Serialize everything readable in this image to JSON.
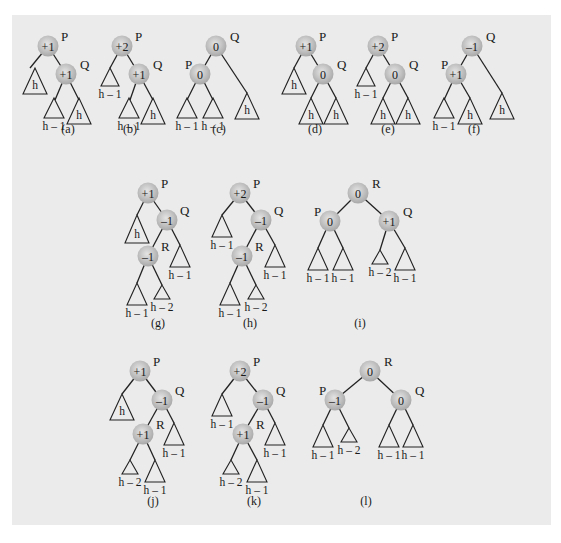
{
  "figure": {
    "panel_color": "#ebebeb",
    "node_color": "#bdbdbd",
    "line_color": "#222222"
  },
  "diagrams": [
    {
      "caption": "(a)",
      "cap": [
        68,
        133
      ],
      "nodes": [
        {
          "id": "P",
          "val": "+1",
          "x": 48,
          "y": 46,
          "lx": 61,
          "ly": 41
        },
        {
          "id": "Q",
          "val": "+1",
          "x": 66,
          "y": 74,
          "lx": 80,
          "ly": 69
        }
      ],
      "edges": [
        [
          48,
          46,
          30,
          68
        ],
        [
          48,
          46,
          66,
          74
        ],
        [
          66,
          74,
          55,
          100
        ],
        [
          66,
          74,
          79,
          100
        ]
      ],
      "subtrees": [
        {
          "x": 35,
          "top": 68,
          "w": 24,
          "h": 26,
          "label": "h",
          "inside": true
        },
        {
          "x": 54,
          "top": 98,
          "w": 20,
          "h": 20,
          "label": "h – 1",
          "inside": false
        },
        {
          "x": 79,
          "top": 98,
          "w": 24,
          "h": 26,
          "label": "h",
          "inside": true
        }
      ]
    },
    {
      "caption": "(b)",
      "cap": [
        130,
        133
      ],
      "nodes": [
        {
          "id": "P",
          "val": "+2",
          "x": 122,
          "y": 46,
          "lx": 135,
          "ly": 41
        },
        {
          "id": "Q",
          "val": "+1",
          "x": 139,
          "y": 74,
          "lx": 153,
          "ly": 69
        }
      ],
      "edges": [
        [
          122,
          46,
          110,
          68
        ],
        [
          122,
          46,
          139,
          74
        ],
        [
          139,
          74,
          130,
          100
        ],
        [
          139,
          74,
          153,
          100
        ]
      ],
      "subtrees": [
        {
          "x": 110,
          "top": 68,
          "w": 18,
          "h": 18,
          "label": "h – 1",
          "inside": false
        },
        {
          "x": 129,
          "top": 98,
          "w": 20,
          "h": 20,
          "label": "h – 1",
          "inside": false
        },
        {
          "x": 153,
          "top": 98,
          "w": 24,
          "h": 26,
          "label": "h",
          "inside": true
        }
      ]
    },
    {
      "caption": "(c)",
      "cap": [
        219,
        133
      ],
      "nodes": [
        {
          "id": "Q",
          "val": "0",
          "x": 216,
          "y": 46,
          "lx": 230,
          "ly": 41
        },
        {
          "id": "P",
          "val": "0",
          "x": 200,
          "y": 74,
          "lx": 185,
          "ly": 69
        }
      ],
      "edges": [
        [
          216,
          46,
          200,
          74
        ],
        [
          216,
          46,
          247,
          93
        ],
        [
          200,
          74,
          187,
          100
        ],
        [
          200,
          74,
          213,
          100
        ]
      ],
      "subtrees": [
        {
          "x": 187,
          "top": 98,
          "w": 20,
          "h": 20,
          "label": "h – 1",
          "inside": false
        },
        {
          "x": 213,
          "top": 98,
          "w": 20,
          "h": 20,
          "label": "h – 1",
          "inside": false
        },
        {
          "x": 247,
          "top": 93,
          "w": 24,
          "h": 26,
          "label": "h",
          "inside": true
        }
      ]
    },
    {
      "caption": "(d)",
      "cap": [
        315,
        133
      ],
      "nodes": [
        {
          "id": "P",
          "val": "+1",
          "x": 306,
          "y": 46,
          "lx": 319,
          "ly": 41
        },
        {
          "id": "Q",
          "val": "0",
          "x": 323,
          "y": 74,
          "lx": 337,
          "ly": 69
        }
      ],
      "edges": [
        [
          306,
          46,
          294,
          68
        ],
        [
          306,
          46,
          323,
          74
        ],
        [
          323,
          74,
          311,
          98
        ],
        [
          323,
          74,
          336,
          98
        ]
      ],
      "subtrees": [
        {
          "x": 294,
          "top": 68,
          "w": 24,
          "h": 26,
          "label": "h",
          "inside": true
        },
        {
          "x": 311,
          "top": 98,
          "w": 24,
          "h": 26,
          "label": "h",
          "inside": true
        },
        {
          "x": 336,
          "top": 98,
          "w": 24,
          "h": 26,
          "label": "h",
          "inside": true
        }
      ]
    },
    {
      "caption": "(e)",
      "cap": [
        388,
        133
      ],
      "nodes": [
        {
          "id": "P",
          "val": "+2",
          "x": 378,
          "y": 46,
          "lx": 391,
          "ly": 41
        },
        {
          "id": "Q",
          "val": "0",
          "x": 395,
          "y": 74,
          "lx": 409,
          "ly": 69
        }
      ],
      "edges": [
        [
          378,
          46,
          366,
          68
        ],
        [
          378,
          46,
          395,
          74
        ],
        [
          395,
          74,
          383,
          98
        ],
        [
          395,
          74,
          408,
          98
        ]
      ],
      "subtrees": [
        {
          "x": 366,
          "top": 68,
          "w": 18,
          "h": 18,
          "label": "h – 1",
          "inside": false
        },
        {
          "x": 383,
          "top": 98,
          "w": 24,
          "h": 26,
          "label": "h",
          "inside": true
        },
        {
          "x": 408,
          "top": 98,
          "w": 24,
          "h": 26,
          "label": "h",
          "inside": true
        }
      ]
    },
    {
      "caption": "(f)",
      "cap": [
        474,
        133
      ],
      "nodes": [
        {
          "id": "Q",
          "val": "–1",
          "x": 472,
          "y": 46,
          "lx": 486,
          "ly": 41
        },
        {
          "id": "P",
          "val": "+1",
          "x": 456,
          "y": 74,
          "lx": 441,
          "ly": 69
        }
      ],
      "edges": [
        [
          472,
          46,
          456,
          74
        ],
        [
          472,
          46,
          502,
          93
        ],
        [
          456,
          74,
          444,
          100
        ],
        [
          456,
          74,
          470,
          98
        ]
      ],
      "subtrees": [
        {
          "x": 444,
          "top": 98,
          "w": 20,
          "h": 20,
          "label": "h – 1",
          "inside": false
        },
        {
          "x": 470,
          "top": 98,
          "w": 24,
          "h": 26,
          "label": "h",
          "inside": true
        },
        {
          "x": 502,
          "top": 93,
          "w": 24,
          "h": 26,
          "label": "h",
          "inside": true
        }
      ]
    },
    {
      "caption": "(g)",
      "cap": [
        158,
        327
      ],
      "nodes": [
        {
          "id": "P",
          "val": "+1",
          "x": 148,
          "y": 193,
          "lx": 161,
          "ly": 188
        },
        {
          "id": "Q",
          "val": "–1",
          "x": 167,
          "y": 220,
          "lx": 180,
          "ly": 215
        },
        {
          "id": "R",
          "val": "–1",
          "x": 148,
          "y": 256,
          "lx": 161,
          "ly": 251
        }
      ],
      "edges": [
        [
          148,
          193,
          137,
          215
        ],
        [
          148,
          193,
          167,
          220
        ],
        [
          167,
          220,
          148,
          256
        ],
        [
          167,
          220,
          180,
          245
        ],
        [
          148,
          256,
          137,
          283
        ],
        [
          148,
          256,
          162,
          285
        ]
      ],
      "subtrees": [
        {
          "x": 137,
          "top": 215,
          "w": 24,
          "h": 28,
          "label": "h",
          "inside": true
        },
        {
          "x": 180,
          "top": 245,
          "w": 20,
          "h": 22,
          "label": "h – 1",
          "inside": false
        },
        {
          "x": 137,
          "top": 283,
          "w": 20,
          "h": 22,
          "label": "h – 1",
          "inside": false
        },
        {
          "x": 162,
          "top": 285,
          "w": 16,
          "h": 14,
          "label": "h – 2",
          "inside": false
        }
      ]
    },
    {
      "caption": "(h)",
      "cap": [
        250,
        327
      ],
      "nodes": [
        {
          "id": "P",
          "val": "+2",
          "x": 240,
          "y": 193,
          "lx": 253,
          "ly": 188
        },
        {
          "id": "Q",
          "val": "–1",
          "x": 261,
          "y": 220,
          "lx": 274,
          "ly": 215
        },
        {
          "id": "R",
          "val": "–1",
          "x": 242,
          "y": 256,
          "lx": 255,
          "ly": 251
        }
      ],
      "edges": [
        [
          240,
          193,
          222,
          215
        ],
        [
          240,
          193,
          261,
          220
        ],
        [
          261,
          220,
          242,
          256
        ],
        [
          261,
          220,
          275,
          245
        ],
        [
          242,
          256,
          230,
          283
        ],
        [
          242,
          256,
          256,
          285
        ]
      ],
      "subtrees": [
        {
          "x": 222,
          "top": 215,
          "w": 20,
          "h": 22,
          "label": "h – 1",
          "inside": false
        },
        {
          "x": 275,
          "top": 245,
          "w": 20,
          "h": 22,
          "label": "h – 1",
          "inside": false
        },
        {
          "x": 230,
          "top": 283,
          "w": 20,
          "h": 22,
          "label": "h – 1",
          "inside": false
        },
        {
          "x": 256,
          "top": 285,
          "w": 16,
          "h": 14,
          "label": "h – 2",
          "inside": false
        }
      ]
    },
    {
      "caption": "(i)",
      "cap": [
        360,
        327
      ],
      "nodes": [
        {
          "id": "R",
          "val": "0",
          "x": 358,
          "y": 193,
          "lx": 372,
          "ly": 188
        },
        {
          "id": "P",
          "val": "0",
          "x": 330,
          "y": 221,
          "lx": 314,
          "ly": 216
        },
        {
          "id": "Q",
          "val": "+1",
          "x": 389,
          "y": 221,
          "lx": 403,
          "ly": 216
        }
      ],
      "edges": [
        [
          358,
          193,
          330,
          221
        ],
        [
          358,
          193,
          389,
          221
        ],
        [
          330,
          221,
          318,
          248
        ],
        [
          330,
          221,
          343,
          248
        ],
        [
          389,
          221,
          380,
          250
        ],
        [
          389,
          221,
          405,
          248
        ]
      ],
      "subtrees": [
        {
          "x": 318,
          "top": 248,
          "w": 20,
          "h": 22,
          "label": "h – 1",
          "inside": false
        },
        {
          "x": 343,
          "top": 248,
          "w": 20,
          "h": 22,
          "label": "h – 1",
          "inside": false
        },
        {
          "x": 380,
          "top": 250,
          "w": 16,
          "h": 14,
          "label": "h – 2",
          "inside": false
        },
        {
          "x": 405,
          "top": 248,
          "w": 20,
          "h": 22,
          "label": "h – 1",
          "inside": false
        }
      ]
    },
    {
      "caption": "(j)",
      "cap": [
        153,
        505
      ],
      "nodes": [
        {
          "id": "P",
          "val": "+1",
          "x": 140,
          "y": 371,
          "lx": 153,
          "ly": 366
        },
        {
          "id": "Q",
          "val": "–1",
          "x": 162,
          "y": 400,
          "lx": 175,
          "ly": 395
        },
        {
          "id": "R",
          "val": "+1",
          "x": 143,
          "y": 434,
          "lx": 156,
          "ly": 429
        }
      ],
      "edges": [
        [
          140,
          371,
          122,
          394
        ],
        [
          140,
          371,
          162,
          400
        ],
        [
          162,
          400,
          143,
          434
        ],
        [
          162,
          400,
          174,
          423
        ],
        [
          143,
          434,
          130,
          460
        ],
        [
          143,
          434,
          155,
          460
        ]
      ],
      "subtrees": [
        {
          "x": 122,
          "top": 394,
          "w": 24,
          "h": 26,
          "label": "h",
          "inside": true
        },
        {
          "x": 174,
          "top": 423,
          "w": 20,
          "h": 22,
          "label": "h – 1",
          "inside": false
        },
        {
          "x": 130,
          "top": 460,
          "w": 16,
          "h": 14,
          "label": "h – 2",
          "inside": false
        },
        {
          "x": 155,
          "top": 460,
          "w": 20,
          "h": 22,
          "label": "h – 1",
          "inside": false
        }
      ]
    },
    {
      "caption": "(k)",
      "cap": [
        254,
        505
      ],
      "nodes": [
        {
          "id": "P",
          "val": "+2",
          "x": 240,
          "y": 371,
          "lx": 253,
          "ly": 366
        },
        {
          "id": "Q",
          "val": "–1",
          "x": 263,
          "y": 400,
          "lx": 276,
          "ly": 395
        },
        {
          "id": "R",
          "val": "+1",
          "x": 243,
          "y": 434,
          "lx": 256,
          "ly": 429
        }
      ],
      "edges": [
        [
          240,
          371,
          222,
          394
        ],
        [
          240,
          371,
          263,
          400
        ],
        [
          263,
          400,
          243,
          434
        ],
        [
          263,
          400,
          275,
          423
        ],
        [
          243,
          434,
          231,
          460
        ],
        [
          243,
          434,
          257,
          460
        ]
      ],
      "subtrees": [
        {
          "x": 222,
          "top": 394,
          "w": 20,
          "h": 22,
          "label": "h – 1",
          "inside": false
        },
        {
          "x": 275,
          "top": 423,
          "w": 20,
          "h": 22,
          "label": "h – 1",
          "inside": false
        },
        {
          "x": 231,
          "top": 460,
          "w": 16,
          "h": 14,
          "label": "h – 2",
          "inside": false
        },
        {
          "x": 257,
          "top": 460,
          "w": 20,
          "h": 22,
          "label": "h – 1",
          "inside": false
        }
      ]
    },
    {
      "caption": "(l)",
      "cap": [
        366,
        505
      ],
      "nodes": [
        {
          "id": "R",
          "val": "0",
          "x": 370,
          "y": 371,
          "lx": 384,
          "ly": 366
        },
        {
          "id": "P",
          "val": "–1",
          "x": 335,
          "y": 400,
          "lx": 319,
          "ly": 395
        },
        {
          "id": "Q",
          "val": "0",
          "x": 401,
          "y": 400,
          "lx": 415,
          "ly": 395
        }
      ],
      "edges": [
        [
          370,
          371,
          335,
          400
        ],
        [
          370,
          371,
          401,
          400
        ],
        [
          335,
          400,
          323,
          425
        ],
        [
          335,
          400,
          349,
          428
        ],
        [
          401,
          400,
          389,
          425
        ],
        [
          401,
          400,
          413,
          425
        ]
      ],
      "subtrees": [
        {
          "x": 323,
          "top": 425,
          "w": 20,
          "h": 22,
          "label": "h – 1",
          "inside": false
        },
        {
          "x": 349,
          "top": 428,
          "w": 16,
          "h": 14,
          "label": "h – 2",
          "inside": false
        },
        {
          "x": 389,
          "top": 425,
          "w": 20,
          "h": 22,
          "label": "h – 1",
          "inside": false
        },
        {
          "x": 413,
          "top": 425,
          "w": 20,
          "h": 22,
          "label": "h – 1",
          "inside": false
        }
      ]
    }
  ]
}
